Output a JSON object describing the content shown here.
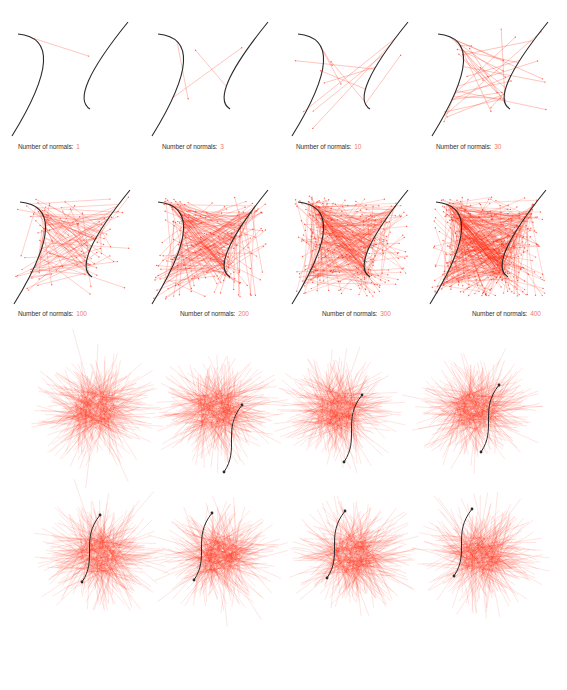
{
  "figure": {
    "caption_prefix": "Number of normals:",
    "colors": {
      "curve": "#2b2b2b",
      "normal_line": "#ff2a10",
      "count_text": "#f07a66",
      "label_text": "#333333"
    },
    "rows": [
      {
        "name": "normals-progression-row-1",
        "panels": [
          {
            "count": 1,
            "label_count": "1"
          },
          {
            "count": 3,
            "label_count": "3"
          },
          {
            "count": 10,
            "label_count": "10"
          },
          {
            "count": 30,
            "label_count": "30"
          }
        ]
      },
      {
        "name": "normals-progression-row-2",
        "panels": [
          {
            "count": 100,
            "label_count": "100"
          },
          {
            "count": 200,
            "label_count": "200"
          },
          {
            "count": 300,
            "label_count": "300"
          },
          {
            "count": 400,
            "label_count": "400"
          }
        ]
      },
      {
        "name": "curve-sweep-row-3",
        "panels": [
          {
            "curve_step": 0
          },
          {
            "curve_step": 1
          },
          {
            "curve_step": 2
          },
          {
            "curve_step": 3
          }
        ]
      },
      {
        "name": "curve-sweep-row-4",
        "panels": [
          {
            "curve_step": 4
          },
          {
            "curve_step": 5
          },
          {
            "curve_step": 6
          },
          {
            "curve_step": 7
          }
        ]
      }
    ]
  }
}
